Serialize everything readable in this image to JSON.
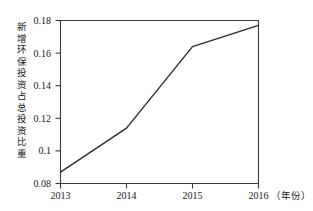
{
  "chart_data": {
    "type": "line",
    "title": "",
    "subtitle": "",
    "xlabel": "",
    "ylabel": "新增环保投资占总投资比重",
    "x_unit_annotation": "（年份）",
    "categories": [
      "2013",
      "2014",
      "2015",
      "2016"
    ],
    "x": [
      2013,
      2014,
      2015,
      2016
    ],
    "series": [
      {
        "name": "新增环保投资占总投资比重",
        "values": [
          0.087,
          0.114,
          0.164,
          0.177
        ]
      }
    ],
    "xlim": [
      2013,
      2016
    ],
    "ylim": [
      0.08,
      0.18
    ],
    "ytick_labels": [
      "0.08",
      "0.1",
      "0.12",
      "0.14",
      "0.16",
      "0.18"
    ],
    "ytick_values": [
      0.08,
      0.1,
      0.12,
      0.14,
      0.16,
      0.18
    ],
    "xtick_labels": [
      "2013",
      "2014",
      "2015",
      "2016"
    ],
    "grid": false,
    "legend": false,
    "legend_position": "none",
    "line_color": "#2b2b2b",
    "frame_color": "#3a3a3a",
    "background_color": "#ffffff",
    "text_color": "#1a1a1a",
    "annotations": []
  },
  "axis": {
    "y_label_chars": [
      "新",
      "增",
      "环",
      "保",
      "投",
      "资",
      "占",
      "总",
      "投",
      "资",
      "比",
      "重"
    ],
    "y_ticks": [
      {
        "label": "0.18",
        "value": 0.18
      },
      {
        "label": "0.16",
        "value": 0.16
      },
      {
        "label": "0.14",
        "value": 0.14
      },
      {
        "label": "0.12",
        "value": 0.12
      },
      {
        "label": "0.1",
        "value": 0.1
      },
      {
        "label": "0.08",
        "value": 0.08
      }
    ],
    "x_ticks": [
      {
        "label": "2013",
        "value": 2013
      },
      {
        "label": "2014",
        "value": 2014
      },
      {
        "label": "2015",
        "value": 2015
      },
      {
        "label": "2016",
        "value": 2016
      }
    ],
    "x_unit": "（年份）"
  }
}
